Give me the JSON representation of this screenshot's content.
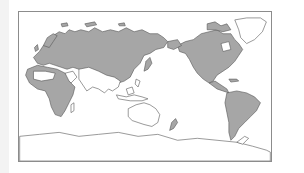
{
  "map": {
    "projection": "Pacific-centered equirectangular world map",
    "colors": {
      "filled_land": "#a6a6a6",
      "outline": "#555555",
      "unfilled_land": "#ffffff",
      "ocean": "#ffffff",
      "frame": "#8c8c8c",
      "left_strip": "#f3f3f3"
    },
    "regions_filled": [
      "Europe",
      "Northern & Central Asia",
      "North Africa (partial)",
      "Sub-Saharan Africa (partial)",
      "Japan",
      "North America",
      "Central America",
      "South America",
      "New Zealand",
      "Madagascar (outline)"
    ],
    "regions_outline_only": [
      "Sahara / Arabian interior",
      "South & Southeast Asia",
      "Maritime Southeast Asia",
      "Australia",
      "Greenland",
      "Antarctica"
    ],
    "label": "World map showing shaded distribution"
  }
}
